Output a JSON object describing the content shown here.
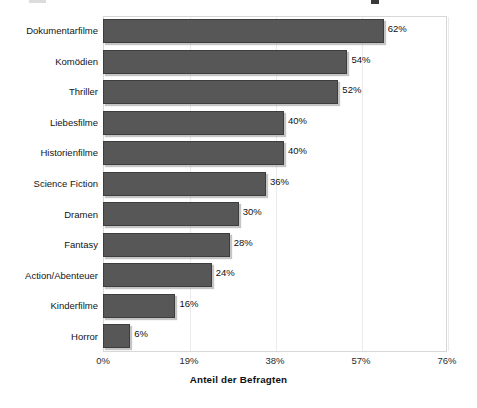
{
  "chart_data": {
    "type": "bar",
    "orientation": "horizontal",
    "title": "",
    "xlabel": "Anteil der Befragten",
    "ylabel": "",
    "xlim": [
      0,
      76
    ],
    "xticks": [
      "0%",
      "19%",
      "38%",
      "57%",
      "76%"
    ],
    "xtick_values": [
      0,
      19,
      38,
      57,
      76
    ],
    "grid": true,
    "legend": "none",
    "categories": [
      "Dokumentarfilme",
      "Komödien",
      "Thriller",
      "Liebesfilme",
      "Historienfilme",
      "Science Fiction",
      "Dramen",
      "Fantasy",
      "Action/Abenteuer",
      "Kinderfilme",
      "Horror"
    ],
    "values": [
      62,
      54,
      52,
      40,
      40,
      36,
      30,
      28,
      24,
      16,
      6
    ],
    "value_labels": [
      "62%",
      "54%",
      "52%",
      "40%",
      "40%",
      "36%",
      "30%",
      "28%",
      "24%",
      "16%",
      "6%"
    ],
    "bar_color": "#575757",
    "bar_edge_color": "#3d3d3d",
    "plot_frame_color": "#d7d7d7",
    "gridline_color": "#ebebeb",
    "background": "#ffffff"
  }
}
